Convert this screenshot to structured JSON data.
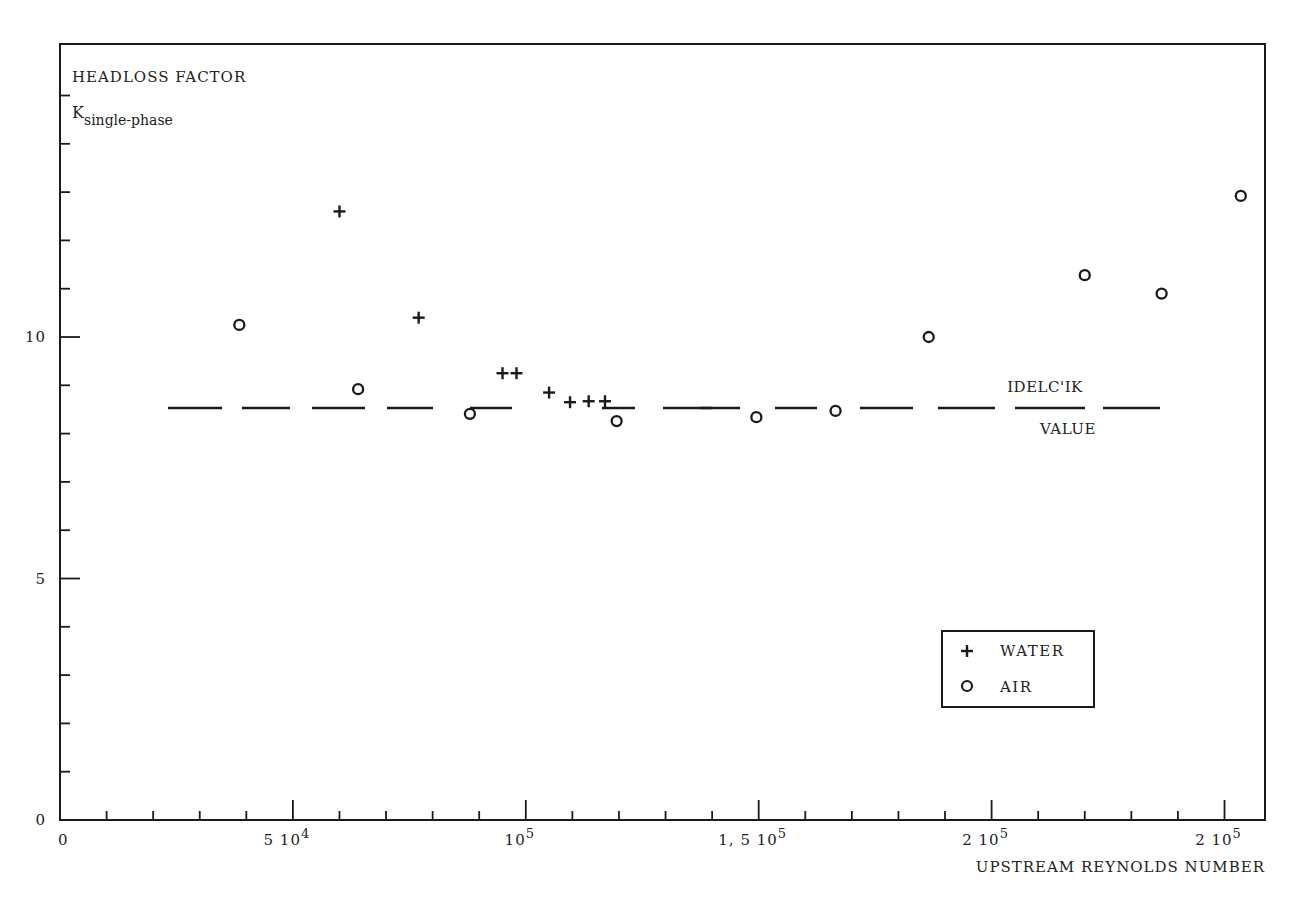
{
  "chart_data": {
    "type": "scatter",
    "title": "",
    "ylabel": "HEADLOSS FACTOR",
    "ylabel_symbol": "K",
    "ylabel_subscript": "single-phase",
    "xlabel": "UPSTREAM REYNOLDS NUMBER",
    "xlim": [
      0,
      260000
    ],
    "ylim": [
      0,
      16
    ],
    "grid": false,
    "x_ticks": {
      "major": [
        {
          "value": 0,
          "label": "0",
          "sup": ""
        },
        {
          "value": 50000,
          "label": "5 10",
          "sup": "4"
        },
        {
          "value": 100000,
          "label": "10",
          "sup": "5"
        },
        {
          "value": 150000,
          "label": "1, 5 10",
          "sup": "5"
        },
        {
          "value": 200000,
          "label": "2 10",
          "sup": "5"
        },
        {
          "value": 250000,
          "label": "2 10",
          "sup": "5"
        }
      ],
      "minor_step": 10000
    },
    "y_ticks": {
      "major": [
        {
          "value": 0,
          "label": "0"
        },
        {
          "value": 5,
          "label": "5"
        },
        {
          "value": 10,
          "label": "10"
        }
      ],
      "minor_step": 1
    },
    "reference_line": {
      "name": "IDELC'IK VALUE",
      "label_top": "IDELC'IK",
      "label_bottom": "VALUE",
      "y": 8.53,
      "style": "dashed",
      "x_start": 23000,
      "x_end": 236000
    },
    "legend": {
      "position": "lower-right",
      "entries": [
        {
          "marker": "+",
          "label": "WATER"
        },
        {
          "marker": "o",
          "label": "AIR"
        }
      ]
    },
    "series": [
      {
        "name": "WATER",
        "marker": "+",
        "points": [
          {
            "x": 60000,
            "y": 12.6
          },
          {
            "x": 77000,
            "y": 10.4
          },
          {
            "x": 95000,
            "y": 9.25
          },
          {
            "x": 98000,
            "y": 9.25
          },
          {
            "x": 105000,
            "y": 8.85
          },
          {
            "x": 109500,
            "y": 8.65
          },
          {
            "x": 113500,
            "y": 8.67
          },
          {
            "x": 117000,
            "y": 8.67
          }
        ]
      },
      {
        "name": "AIR",
        "marker": "o",
        "points": [
          {
            "x": 38500,
            "y": 10.25
          },
          {
            "x": 64000,
            "y": 8.92
          },
          {
            "x": 88000,
            "y": 8.41
          },
          {
            "x": 119500,
            "y": 8.26
          },
          {
            "x": 149500,
            "y": 8.34
          },
          {
            "x": 166500,
            "y": 8.47
          },
          {
            "x": 186500,
            "y": 10.0
          },
          {
            "x": 220000,
            "y": 11.28
          },
          {
            "x": 236500,
            "y": 10.9
          },
          {
            "x": 253500,
            "y": 12.92
          }
        ]
      }
    ]
  },
  "layout": {
    "frame": {
      "left": 60,
      "top": 44,
      "right": 1265,
      "bottom": 820
    },
    "px_per_x_unit": 0.004658,
    "px_per_y_unit": 48.3,
    "ink_color": "#1a1a1a",
    "background": "#ffffff"
  }
}
